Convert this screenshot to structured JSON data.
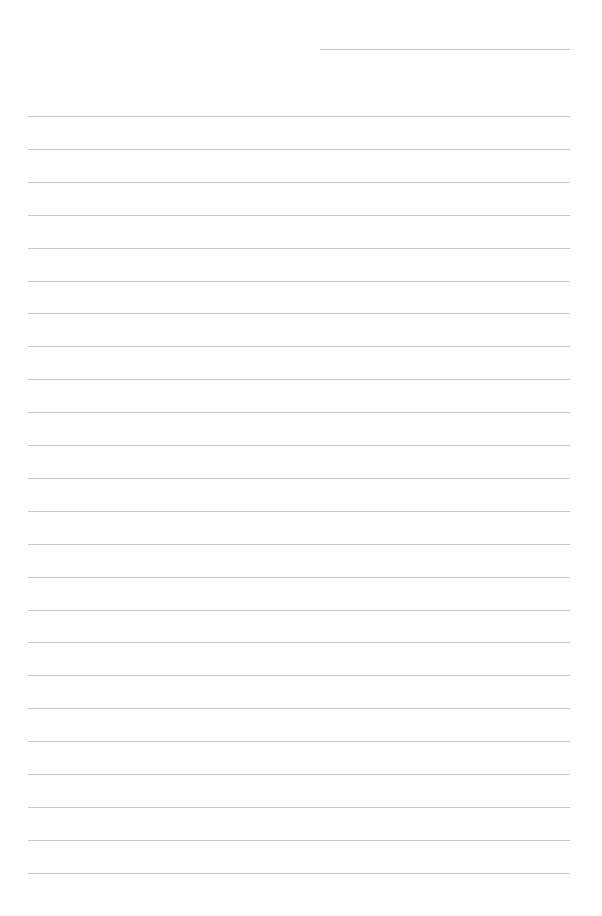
{
  "page": {
    "type": "lined-paper",
    "background_color": "#ffffff",
    "line_color": "#c8c8c8",
    "header_line": {
      "left": 320,
      "top": 49,
      "width": 250
    },
    "rules": {
      "count": 24,
      "first_top": 116,
      "spacing": 32.9,
      "left": 28,
      "width": 542
    }
  }
}
